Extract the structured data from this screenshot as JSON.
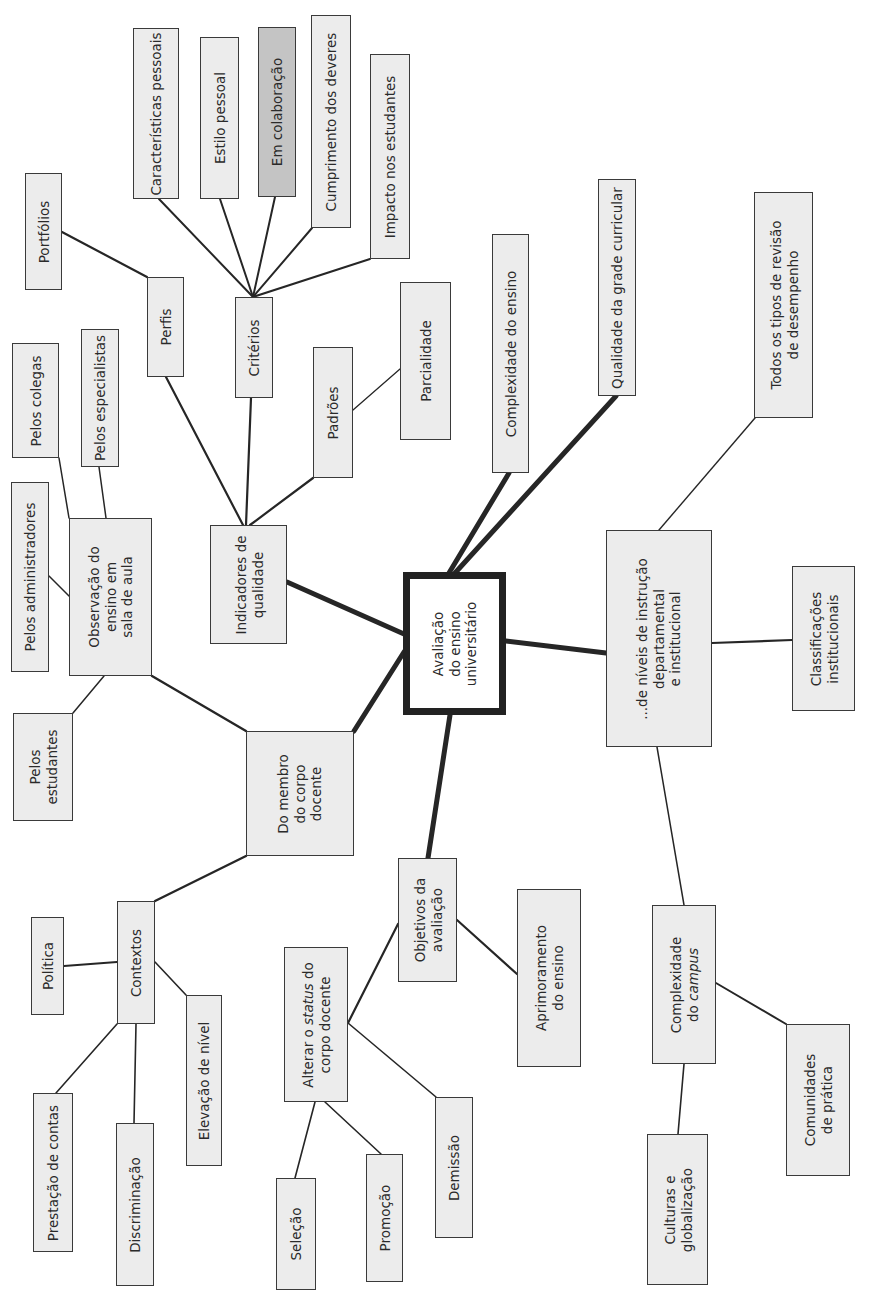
{
  "diagram": {
    "type": "mind-map",
    "orientation": "rotated -90deg (text reads bottom-to-top)",
    "colors": {
      "node_fill": "#ececec",
      "highlight_fill": "#c4c4c4",
      "border": "#3a3a3a",
      "central_border": "#222222",
      "line": "#2a2a2a"
    },
    "central": {
      "id": "central",
      "label": "Avaliação\ndo ensino\nuniversitário"
    },
    "nodes": [
      {
        "id": "caracteristicas",
        "label": "Características pessoais"
      },
      {
        "id": "estilo",
        "label": "Estilo pessoal"
      },
      {
        "id": "colaboracao",
        "label": "Em colaboração",
        "highlighted": true
      },
      {
        "id": "cumprimento",
        "label": "Cumprimento dos deveres"
      },
      {
        "id": "impacto",
        "label": "Impacto nos estudantes"
      },
      {
        "id": "portfolios",
        "label": "Portfólios"
      },
      {
        "id": "perfis",
        "label": "Perfis"
      },
      {
        "id": "criterios",
        "label": "Critérios"
      },
      {
        "id": "colegas",
        "label": "Pelos colegas"
      },
      {
        "id": "especialistas",
        "label": "Pelos especialistas"
      },
      {
        "id": "administradores",
        "label": "Pelos administradores"
      },
      {
        "id": "observacao",
        "label": "Observação do\nensino em\nsala de aula"
      },
      {
        "id": "indicadores",
        "label": "Indicadores de\nqualidade"
      },
      {
        "id": "padroes",
        "label": "Padrões"
      },
      {
        "id": "parcialidade",
        "label": "Parcialidade"
      },
      {
        "id": "complexidade_ensino",
        "label": "Complexidade do ensino"
      },
      {
        "id": "qualidade_grade",
        "label": "Qualidade da grade curricular"
      },
      {
        "id": "todos_tipos",
        "label": "Todos os tipos de revisão\nde desempenho"
      },
      {
        "id": "niveis",
        "label": "...de níveis de instrução\ndepartamental\ne institucional"
      },
      {
        "id": "classificacoes",
        "label": "Classificações\ninstitucionais"
      },
      {
        "id": "pelos_estudantes",
        "label": "Pelos\nestudantes"
      },
      {
        "id": "membro",
        "label": "Do membro\ndo corpo\ndocente"
      },
      {
        "id": "objetivos",
        "label": "Objetivos da\navaliação"
      },
      {
        "id": "contextos",
        "label": "Contextos"
      },
      {
        "id": "politica",
        "label": "Política"
      },
      {
        "id": "elevacao",
        "label": "Elevação de nível"
      },
      {
        "id": "prestacao",
        "label": "Prestação de contas"
      },
      {
        "id": "discriminacao",
        "label": "Discriminação"
      },
      {
        "id": "alterar_status",
        "label": "Alterar o status do\ncorpo docente",
        "italic_word": "status"
      },
      {
        "id": "selecao",
        "label": "Seleção"
      },
      {
        "id": "promocao",
        "label": "Promoção"
      },
      {
        "id": "demissao",
        "label": "Demissão"
      },
      {
        "id": "aprimoramento",
        "label": "Aprimoramento\ndo ensino"
      },
      {
        "id": "complexidade_campus",
        "label": "Complexidade\ndo campus",
        "italic_word": "campus"
      },
      {
        "id": "culturas",
        "label": "Culturas e\nglobalização"
      },
      {
        "id": "comunidades",
        "label": "Comunidades\nde prática"
      }
    ],
    "edges": [
      {
        "from": "central",
        "to": "indicadores",
        "weight": "thick"
      },
      {
        "from": "central",
        "to": "membro",
        "weight": "thick"
      },
      {
        "from": "central",
        "to": "objetivos",
        "weight": "thick"
      },
      {
        "from": "central",
        "to": "niveis",
        "weight": "thick"
      },
      {
        "from": "central",
        "to": "complexidade_ensino",
        "weight": "thick"
      },
      {
        "from": "central",
        "to": "qualidade_grade",
        "weight": "thick"
      },
      {
        "from": "indicadores",
        "to": "perfis",
        "weight": "medium"
      },
      {
        "from": "indicadores",
        "to": "criterios",
        "weight": "medium"
      },
      {
        "from": "indicadores",
        "to": "padroes",
        "weight": "medium"
      },
      {
        "from": "perfis",
        "to": "portfolios",
        "weight": "medium"
      },
      {
        "from": "criterios",
        "to": "caracteristicas",
        "weight": "medium"
      },
      {
        "from": "criterios",
        "to": "estilo",
        "weight": "medium"
      },
      {
        "from": "criterios",
        "to": "colaboracao",
        "weight": "medium"
      },
      {
        "from": "criterios",
        "to": "cumprimento",
        "weight": "medium"
      },
      {
        "from": "criterios",
        "to": "impacto",
        "weight": "medium"
      },
      {
        "from": "padroes",
        "to": "parcialidade",
        "weight": "thin"
      },
      {
        "from": "membro",
        "to": "observacao",
        "weight": "medium"
      },
      {
        "from": "membro",
        "to": "contextos",
        "weight": "medium"
      },
      {
        "from": "observacao",
        "to": "colegas",
        "weight": "thin"
      },
      {
        "from": "observacao",
        "to": "especialistas",
        "weight": "thin"
      },
      {
        "from": "observacao",
        "to": "administradores",
        "weight": "thin"
      },
      {
        "from": "observacao",
        "to": "pelos_estudantes",
        "weight": "thin"
      },
      {
        "from": "contextos",
        "to": "politica",
        "weight": "medium"
      },
      {
        "from": "contextos",
        "to": "elevacao",
        "weight": "thin"
      },
      {
        "from": "contextos",
        "to": "prestacao",
        "weight": "thin"
      },
      {
        "from": "contextos",
        "to": "discriminacao",
        "weight": "thin"
      },
      {
        "from": "objetivos",
        "to": "alterar_status",
        "weight": "medium"
      },
      {
        "from": "objetivos",
        "to": "aprimoramento",
        "weight": "medium"
      },
      {
        "from": "alterar_status",
        "to": "selecao",
        "weight": "thin"
      },
      {
        "from": "alterar_status",
        "to": "promocao",
        "weight": "thin"
      },
      {
        "from": "alterar_status",
        "to": "demissao",
        "weight": "thin"
      },
      {
        "from": "niveis",
        "to": "todos_tipos",
        "weight": "thin"
      },
      {
        "from": "niveis",
        "to": "classificacoes",
        "weight": "medium"
      },
      {
        "from": "niveis",
        "to": "complexidade_campus",
        "weight": "thin"
      },
      {
        "from": "complexidade_campus",
        "to": "culturas",
        "weight": "thin"
      },
      {
        "from": "complexidade_campus",
        "to": "comunidades",
        "weight": "medium"
      }
    ]
  }
}
